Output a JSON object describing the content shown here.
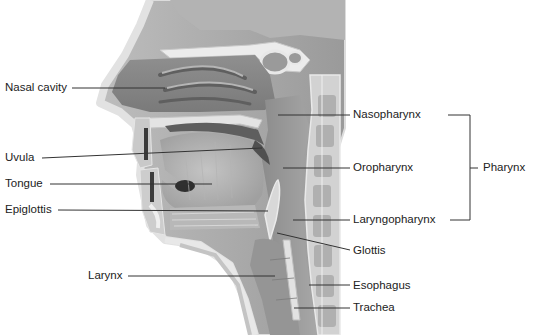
{
  "diagram": {
    "left_labels": [
      {
        "id": "nasal-cavity",
        "text": "Nasal cavity",
        "x": 5,
        "y": 81
      },
      {
        "id": "uvula",
        "text": "Uvula",
        "x": 5,
        "y": 151
      },
      {
        "id": "tongue",
        "text": "Tongue",
        "x": 5,
        "y": 177
      },
      {
        "id": "epiglottis",
        "text": "Epiglottis",
        "x": 5,
        "y": 203
      },
      {
        "id": "larynx",
        "text": "Larynx",
        "x": 88,
        "y": 269
      }
    ],
    "right_labels": [
      {
        "id": "nasopharynx",
        "text": "Nasopharynx",
        "x": 353,
        "y": 108
      },
      {
        "id": "oropharynx",
        "text": "Oropharynx",
        "x": 353,
        "y": 161
      },
      {
        "id": "laryngopharynx",
        "text": "Laryngopharynx",
        "x": 353,
        "y": 213
      },
      {
        "id": "glottis",
        "text": "Glottis",
        "x": 353,
        "y": 244
      },
      {
        "id": "esophagus",
        "text": "Esophagus",
        "x": 353,
        "y": 279
      },
      {
        "id": "trachea",
        "text": "Trachea",
        "x": 353,
        "y": 301
      }
    ],
    "bracket": {
      "label": "Pharynx",
      "x": 483,
      "y": 161,
      "groups": [
        "Nasopharynx",
        "Oropharynx",
        "Laryngopharynx"
      ]
    },
    "colors": {
      "background": "#ffffff",
      "text": "#222222",
      "leader_line": "#333333",
      "tissue_dark": "#8a8a8a",
      "tissue_mid": "#a9a9a9",
      "tissue_light": "#cfcfcf",
      "bone": "#e6e6e6"
    }
  }
}
